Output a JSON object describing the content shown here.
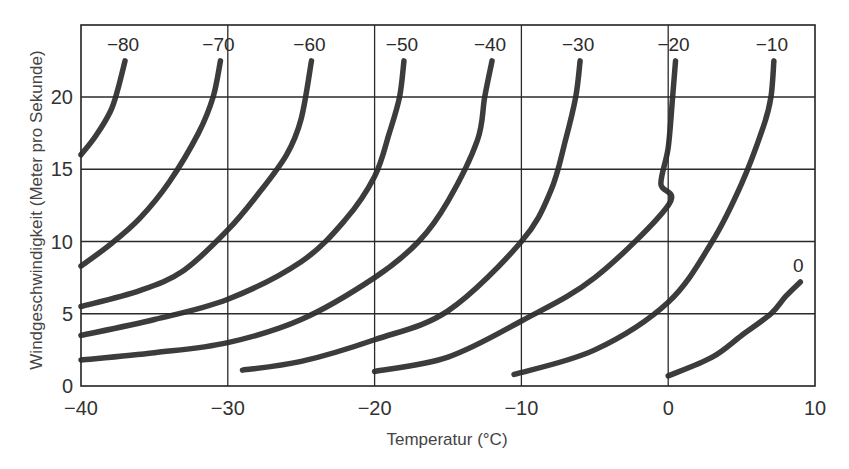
{
  "chart_data": {
    "type": "line",
    "title": "",
    "xlabel": "Temperatur (°C)",
    "ylabel": "Windgeschwindigkeit (Meter pro Sekunde)",
    "xlim": [
      -40,
      10
    ],
    "ylim": [
      0,
      25
    ],
    "xticks": [
      -40,
      -30,
      -20,
      -10,
      0,
      10
    ],
    "xtick_labels": [
      "−40",
      "−30",
      "−20",
      "−10",
      "0",
      "10"
    ],
    "yticks": [
      0,
      5,
      10,
      15,
      20
    ],
    "ytick_labels": [
      "0",
      "5",
      "10",
      "15",
      "20"
    ],
    "grid": true,
    "legend": "none (curves labeled inline at top)",
    "series": [
      {
        "name": "−80",
        "label": "−80",
        "points": [
          [
            -40,
            16.0
          ],
          [
            -39,
            17.3
          ],
          [
            -38,
            19.0
          ],
          [
            -37.5,
            20.5
          ],
          [
            -37,
            22.5
          ]
        ]
      },
      {
        "name": "−70",
        "label": "−70",
        "points": [
          [
            -40,
            8.3
          ],
          [
            -38,
            9.8
          ],
          [
            -36,
            11.6
          ],
          [
            -34,
            14.1
          ],
          [
            -32,
            17.5
          ],
          [
            -31,
            20.0
          ],
          [
            -30.5,
            22.5
          ]
        ]
      },
      {
        "name": "−60",
        "label": "−60",
        "points": [
          [
            -40,
            5.5
          ],
          [
            -36,
            6.6
          ],
          [
            -33,
            8.0
          ],
          [
            -30,
            10.8
          ],
          [
            -28,
            13.2
          ],
          [
            -26,
            16.0
          ],
          [
            -25,
            18.5
          ],
          [
            -24.3,
            22.5
          ]
        ]
      },
      {
        "name": "−50",
        "label": "−50",
        "points": [
          [
            -40,
            3.5
          ],
          [
            -35,
            4.6
          ],
          [
            -30,
            6.0
          ],
          [
            -25,
            8.6
          ],
          [
            -22,
            11.5
          ],
          [
            -20,
            14.5
          ],
          [
            -19,
            17.5
          ],
          [
            -18.3,
            20.0
          ],
          [
            -18,
            22.5
          ]
        ]
      },
      {
        "name": "−40",
        "label": "−40",
        "points": [
          [
            -40,
            1.8
          ],
          [
            -35,
            2.3
          ],
          [
            -30,
            3.0
          ],
          [
            -25,
            4.6
          ],
          [
            -20,
            7.5
          ],
          [
            -17,
            10.0
          ],
          [
            -15,
            12.8
          ],
          [
            -13,
            17.0
          ],
          [
            -12.5,
            20.0
          ],
          [
            -12,
            22.5
          ]
        ]
      },
      {
        "name": "−30",
        "label": "−30",
        "points": [
          [
            -29,
            1.1
          ],
          [
            -25,
            1.7
          ],
          [
            -20,
            3.2
          ],
          [
            -15,
            5.2
          ],
          [
            -10,
            10.0
          ],
          [
            -8,
            13.5
          ],
          [
            -7,
            17.0
          ],
          [
            -6.3,
            20.0
          ],
          [
            -6,
            22.5
          ]
        ]
      },
      {
        "name": "−20",
        "label": "−20",
        "points": [
          [
            -20,
            1.0
          ],
          [
            -15,
            2.0
          ],
          [
            -10,
            4.5
          ],
          [
            -5,
            7.5
          ],
          [
            0,
            12.5
          ],
          [
            -0.5,
            14.0
          ],
          [
            0,
            16.5
          ],
          [
            0.3,
            20.0
          ],
          [
            0.5,
            22.5
          ]
        ]
      },
      {
        "name": "−10",
        "label": "−10",
        "points": [
          [
            -10.5,
            0.8
          ],
          [
            -5,
            2.5
          ],
          [
            0,
            5.8
          ],
          [
            3,
            10.0
          ],
          [
            5,
            14.0
          ],
          [
            6.5,
            18.0
          ],
          [
            7,
            20.0
          ],
          [
            7.2,
            22.5
          ]
        ]
      },
      {
        "name": "0",
        "label": "0",
        "points": [
          [
            0,
            0.7
          ],
          [
            3,
            2.0
          ],
          [
            5,
            3.5
          ],
          [
            7,
            5.0
          ],
          [
            8,
            6.2
          ],
          [
            9,
            7.2
          ]
        ]
      }
    ]
  },
  "labels": {
    "x_axis": "Temperatur (°C)",
    "y_axis": "Windgeschwindigkeit (Meter pro Sekunde)"
  }
}
